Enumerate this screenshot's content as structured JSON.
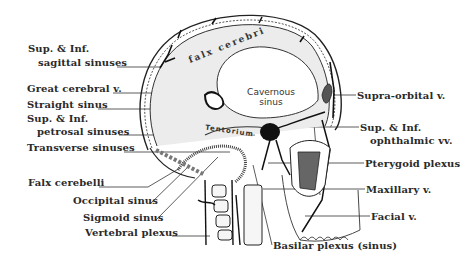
{
  "figure": {
    "colors": {
      "ink": "#222222",
      "background": "#ffffff",
      "dura_fill": "#e6e6e6",
      "sinus_dark": "#1a1a1a",
      "cavity_fill": "#6b6b6b"
    }
  },
  "inner_labels": {
    "falx_cerebri": "falx cerebri",
    "cavernous_sinus_line1": "Cavernous",
    "cavernous_sinus_line2": "sinus",
    "tentorium": "Tentorium"
  },
  "left_labels": [
    {
      "id": "sup-inf-sagittal-1",
      "text": "Sup. & Inf.",
      "x": 28,
      "y": 48
    },
    {
      "id": "sup-inf-sagittal-2",
      "text": "sagittal sinuses",
      "x": 38,
      "y": 62
    },
    {
      "id": "great-cerebral",
      "text": "Great cerebral v.",
      "x": 27,
      "y": 88
    },
    {
      "id": "straight-sinus",
      "text": "Straight sinus",
      "x": 27,
      "y": 104
    },
    {
      "id": "sup-inf-petrosal-1",
      "text": "Sup. & Inf.",
      "x": 27,
      "y": 118
    },
    {
      "id": "sup-inf-petrosal-2",
      "text": "petrosal sinuses",
      "x": 37,
      "y": 131
    },
    {
      "id": "transverse-sinuses",
      "text": "Transverse sinuses",
      "x": 27,
      "y": 147
    },
    {
      "id": "falx-cerebelli",
      "text": "Falx cerebelli",
      "x": 28,
      "y": 182
    },
    {
      "id": "occipital-sinus",
      "text": "Occipital sinus",
      "x": 73,
      "y": 200
    },
    {
      "id": "sigmoid-sinus",
      "text": "Sigmoid sinus",
      "x": 83,
      "y": 217
    },
    {
      "id": "vertebral-plexus",
      "text": "Vertebral plexus",
      "x": 85,
      "y": 232
    }
  ],
  "right_labels": [
    {
      "id": "supra-orbital",
      "text": "Supra-orbital v.",
      "x": 357,
      "y": 90
    },
    {
      "id": "sup-inf-ophthalmic-1",
      "text": "Sup. & Inf.",
      "x": 360,
      "y": 122
    },
    {
      "id": "sup-inf-ophthalmic-2",
      "text": "ophthalmic vv.",
      "x": 370,
      "y": 135
    },
    {
      "id": "pterygoid-plexus",
      "text": "Pterygoid plexus",
      "x": 365,
      "y": 158
    },
    {
      "id": "maxillary",
      "text": "Maxillary v.",
      "x": 366,
      "y": 184
    },
    {
      "id": "facial",
      "text": "Facial v.",
      "x": 371,
      "y": 209
    },
    {
      "id": "basilar-plexus",
      "text": "Basilar plexus (sinus)",
      "x": 273,
      "y": 245
    }
  ]
}
